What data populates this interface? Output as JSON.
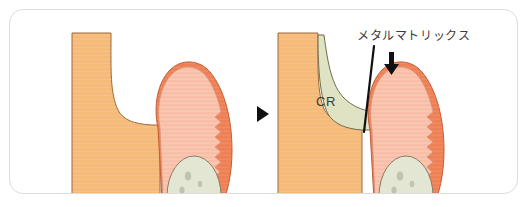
{
  "figure": {
    "title": "",
    "panels": [
      {
        "id": "before",
        "name": "before-restoration",
        "caption": "",
        "regions": [
          {
            "name": "adjacent-tooth",
            "label": "",
            "color": "#F5B978"
          },
          {
            "name": "cavity-gap",
            "label": "",
            "color": "#FFFFFF"
          },
          {
            "name": "tooth-dentin",
            "label": "",
            "color": "#F8BFA8"
          },
          {
            "name": "tooth-enamel",
            "label": "",
            "color": "#EE8055"
          },
          {
            "name": "tooth-pulp",
            "label": "",
            "color": "#E4E6D4"
          }
        ]
      },
      {
        "id": "after",
        "name": "after-restoration",
        "caption": "",
        "regions": [
          {
            "name": "adjacent-tooth",
            "label": "",
            "color": "#F5B978"
          },
          {
            "name": "composite-resin",
            "label": "CR",
            "color": "#DFE3C4"
          },
          {
            "name": "tooth-dentin",
            "label": "",
            "color": "#F8BFA8"
          },
          {
            "name": "tooth-enamel",
            "label": "",
            "color": "#EE8055"
          },
          {
            "name": "tooth-pulp",
            "label": "",
            "color": "#E4E6D4"
          },
          {
            "name": "metal-matrix-band",
            "label": "",
            "color": "#111111"
          }
        ]
      }
    ],
    "labels": {
      "composite_resin": "CR",
      "metal_matrix": "メタルマトリックス"
    },
    "separator": {
      "name": "step-arrow",
      "glyph": "▶",
      "color": "#111111"
    },
    "colors": {
      "card_background": "#FFFFFF",
      "card_border": "#DCDCDC",
      "adjacent_tooth": "#F5B978",
      "adjacent_tooth_outline": "#9A6B3A",
      "dentin": "#F8BFA8",
      "enamel": "#EE8055",
      "pulp": "#E4E6D4",
      "pulp_outline": "#8C7A63",
      "composite_resin": "#DFE3C4",
      "composite_resin_outline": "#6F6B4A",
      "matrix_band": "#111111",
      "label_text": "#3B3B3B"
    }
  }
}
